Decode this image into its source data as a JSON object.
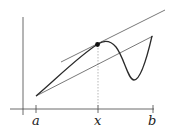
{
  "diagram": {
    "labels": {
      "a": "a",
      "x": "x",
      "b": "b"
    },
    "colors": {
      "stroke": "#333333",
      "curve": "#2a2a2a",
      "point": "#111111",
      "dashed": "#999999"
    }
  }
}
